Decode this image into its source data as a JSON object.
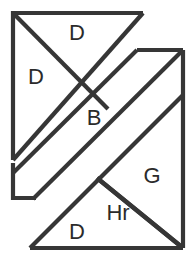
{
  "figure": {
    "canvas": {
      "width": 195,
      "height": 263
    },
    "colors": {
      "background": "#ffffff",
      "stroke": "#363636",
      "label": "#2b2b2b"
    },
    "stroke_width": 4.2,
    "labels": [
      {
        "id": "label-d-top",
        "text": "D",
        "x": 77,
        "y": 34,
        "font_size": 22
      },
      {
        "id": "label-d-left",
        "text": "D",
        "x": 36,
        "y": 78,
        "font_size": 22
      },
      {
        "id": "label-b-band",
        "text": "B",
        "x": 94,
        "y": 119,
        "font_size": 22
      },
      {
        "id": "label-g-right",
        "text": "G",
        "x": 152,
        "y": 177,
        "font_size": 22
      },
      {
        "id": "label-hr-small",
        "text": "Hr",
        "x": 118,
        "y": 214,
        "font_size": 22
      },
      {
        "id": "label-d-bottom",
        "text": "D",
        "x": 77,
        "y": 233,
        "font_size": 22
      }
    ],
    "shapes": [
      {
        "id": "triangle-top-large",
        "name": "top-left-large-triangle",
        "points": "13,13 143,13 13,160"
      },
      {
        "id": "triangle-top-small-divider",
        "name": "top-small-triangle-divider",
        "points": "13,13 107,108"
      },
      {
        "id": "band-upper-parallelogram",
        "name": "upper-diagonal-band",
        "points": "137,50 183,50 36,198 13,198 13,163"
      },
      {
        "id": "band-lower-edge",
        "name": "lower-diagonal-band-edge",
        "points": "183,95 30,248"
      },
      {
        "id": "triangle-right-g",
        "name": "right-triangle-g",
        "points": "183,95 183,248 98,178"
      },
      {
        "id": "triangle-bottom-d",
        "name": "bottom-triangle-d",
        "points": "30,248 183,248 98,178"
      },
      {
        "id": "square-outer",
        "name": "outer-square-boundary",
        "points": "183,50 183,248 30,248"
      }
    ]
  }
}
